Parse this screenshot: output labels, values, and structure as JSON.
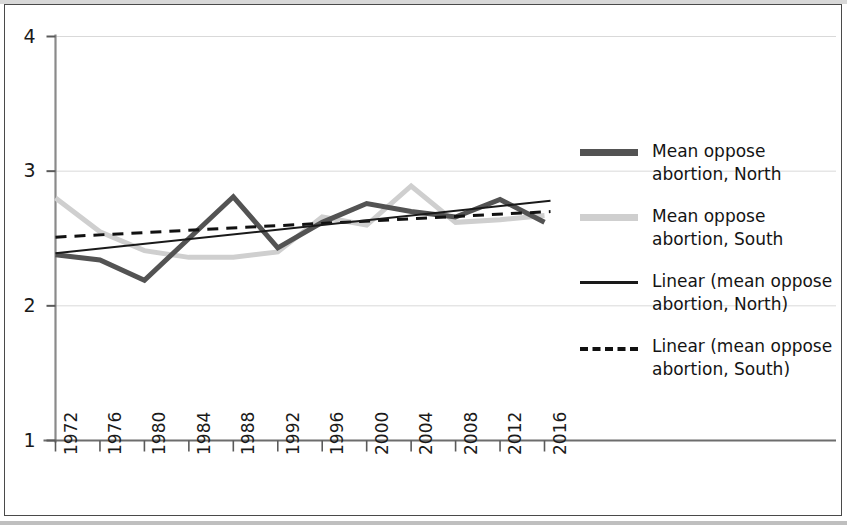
{
  "figure": {
    "background_color": "#ffffff",
    "frame_color": "#4a4a4a"
  },
  "legend": {
    "position": "right",
    "entries": [
      {
        "label": "Mean oppose abortion, North",
        "style": "thick-solid",
        "color": "#535353",
        "name": "legend-mean-north"
      },
      {
        "label": "Mean oppose abortion, South",
        "style": "thick-solid",
        "color": "#cfcfcf",
        "name": "legend-mean-south"
      },
      {
        "label": "Linear (mean oppose abortion, North)",
        "style": "thin-solid",
        "color": "#1a1a1a",
        "name": "legend-trend-north"
      },
      {
        "label": "Linear (mean oppose abortion, South)",
        "style": "dashed",
        "color": "#111111",
        "name": "legend-trend-south"
      }
    ]
  },
  "chart_data": {
    "type": "line",
    "title": "",
    "subtitle": "",
    "xlabel": "",
    "ylabel": "",
    "categories": [
      "1972",
      "1976",
      "1980",
      "1984",
      "1988",
      "1992",
      "1996",
      "2000",
      "2004",
      "2008",
      "2012",
      "2016"
    ],
    "x": [
      1972,
      1976,
      1980,
      1984,
      1988,
      1992,
      1996,
      2000,
      2004,
      2008,
      2012,
      2016
    ],
    "xlim": [
      1972,
      2016
    ],
    "ylim": [
      1,
      4
    ],
    "yticks": [
      1,
      2,
      3,
      4
    ],
    "ytick_labels": [
      "1",
      "2",
      "3",
      "4"
    ],
    "grid": true,
    "grid_axis": "y",
    "grid_color": "#d9d9d9",
    "legend_position": "right",
    "series": [
      {
        "name": "Mean oppose abortion, North",
        "type": "line",
        "color": "#535353",
        "width": 5,
        "dash": "solid",
        "values": [
          2.38,
          2.34,
          2.19,
          2.5,
          2.81,
          2.43,
          2.62,
          2.76,
          2.7,
          2.66,
          2.79,
          2.62
        ]
      },
      {
        "name": "Mean oppose abortion, South",
        "type": "line",
        "color": "#cfcfcf",
        "width": 5,
        "dash": "solid",
        "values": [
          2.8,
          2.55,
          2.41,
          2.36,
          2.36,
          2.4,
          2.66,
          2.6,
          2.89,
          2.62,
          2.64,
          2.67
        ]
      },
      {
        "name": "Linear (mean oppose abortion, North)",
        "type": "trendline",
        "color": "#1a1a1a",
        "width": 2,
        "dash": "solid",
        "endpoints": [
          2.39,
          2.78
        ]
      },
      {
        "name": "Linear (mean oppose abortion, South)",
        "type": "trendline",
        "color": "#111111",
        "width": 3,
        "dash": "dashed",
        "endpoints": [
          2.51,
          2.7
        ]
      }
    ]
  },
  "axes": {
    "y_tick_labels": [
      "4",
      "3",
      "2",
      "1"
    ],
    "x_tick_labels": [
      "1972",
      "1976",
      "1980",
      "1984",
      "1988",
      "1992",
      "1996",
      "2000",
      "2004",
      "2008",
      "2012",
      "2016"
    ]
  }
}
